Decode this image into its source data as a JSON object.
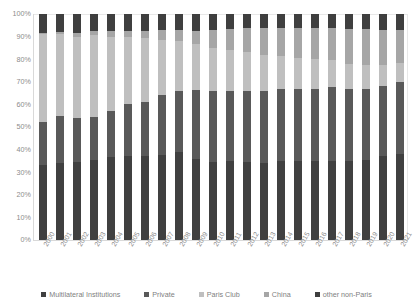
{
  "chart_data": {
    "type": "bar",
    "subtype": "100% stacked column",
    "title": "",
    "xlabel": "",
    "ylabel": "",
    "ylim": [
      0,
      100
    ],
    "ytick_labels": [
      "100%",
      "90%",
      "80%",
      "70%",
      "60%",
      "50%",
      "40%",
      "30%",
      "20%",
      "10%",
      "0%"
    ],
    "ytick_values": [
      100,
      90,
      80,
      70,
      60,
      50,
      40,
      30,
      20,
      10,
      0
    ],
    "grid": false,
    "legend_position": "bottom",
    "categories": [
      "2000",
      "2001",
      "2002",
      "2003",
      "2004",
      "2005",
      "2006",
      "2007",
      "2008",
      "2009",
      "2010",
      "2011",
      "2012",
      "2013",
      "2014",
      "2015",
      "2016",
      "2017",
      "2018",
      "2019",
      "2020",
      "2021"
    ],
    "series": [
      {
        "name": "Multilateral Institutions",
        "color": "#404040",
        "values": [
          33,
          34,
          34.5,
          35.5,
          36.5,
          37,
          37,
          37.5,
          39,
          36,
          34.5,
          35,
          34.5,
          34,
          35,
          35,
          35,
          35,
          35,
          35.5,
          37,
          38
        ]
      },
      {
        "name": "Private",
        "color": "#595959",
        "values": [
          19,
          21,
          19.5,
          19,
          20.5,
          23,
          24,
          26.5,
          27,
          30.5,
          31.5,
          31,
          31.5,
          32,
          32,
          32,
          32,
          32.5,
          32,
          31.5,
          31,
          32
        ]
      },
      {
        "name": "Paris Club",
        "color": "#bfbfbf",
        "values": [
          39,
          36,
          36,
          36,
          33,
          30,
          28.5,
          24.5,
          22,
          20,
          19,
          18,
          17,
          16,
          14.5,
          13.5,
          13,
          12,
          11,
          10.5,
          9.5,
          8.5
        ]
      },
      {
        "name": "China",
        "color": "#a6a6a6",
        "values": [
          0.5,
          1,
          1.5,
          2,
          2.5,
          2.5,
          3,
          4.5,
          5,
          6,
          8,
          9.5,
          11,
          12,
          12.5,
          13.5,
          14,
          14.5,
          15.5,
          16,
          15.5,
          14.5
        ]
      },
      {
        "name": "other non-Paris",
        "color": "#3f3f3f",
        "values": [
          8.5,
          8,
          8.5,
          7.5,
          7.5,
          7.5,
          7.5,
          7,
          7,
          7.5,
          7,
          6.5,
          6,
          6,
          6,
          6,
          6,
          6,
          6.5,
          6.5,
          7,
          7
        ]
      }
    ],
    "legend": [
      {
        "label": "Multilateral Institutions",
        "color": "#404040"
      },
      {
        "label": "Private",
        "color": "#595959"
      },
      {
        "label": "Paris Club",
        "color": "#bfbfbf"
      },
      {
        "label": "China",
        "color": "#a6a6a6"
      },
      {
        "label": "other non-Paris",
        "color": "#3f3f3f"
      }
    ]
  }
}
